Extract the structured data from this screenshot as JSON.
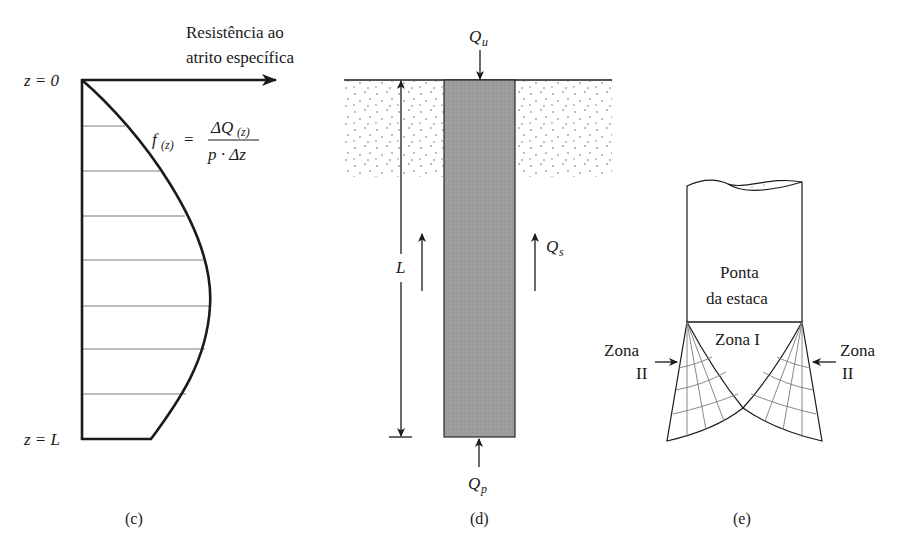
{
  "panels": {
    "c": {
      "caption": "(c)",
      "axis_title_line1": "Resistência ao",
      "axis_title_line2": "atrito específica",
      "z_top_label": "z = 0",
      "z_bottom_label": "z = L",
      "formula": {
        "lhs_f": "f",
        "lhs_sub": "(z)",
        "equals": "=",
        "numerator": "ΔQ",
        "numerator_sub": "(z)",
        "denominator": "p · Δz"
      }
    },
    "d": {
      "caption": "(d)",
      "load_top": "Q",
      "load_top_sub": "u",
      "shaft_resistance": "Q",
      "shaft_resistance_sub": "s",
      "point_resistance": "Q",
      "point_resistance_sub": "p",
      "length_label": "L"
    },
    "e": {
      "caption": "(e)",
      "pile_tip_line1": "Ponta",
      "pile_tip_line2": "da estaca",
      "zone_1": "Zona I",
      "zone_2_left_line1": "Zona",
      "zone_2_left_line2": "II",
      "zone_2_right_line1": "Zona",
      "zone_2_right_line2": "II"
    }
  },
  "colors": {
    "line": "#1a1a1a",
    "pile_fill": "#9a9a9a",
    "soil_dots": "#6a6a6a",
    "hatch": "#7a7a7a"
  }
}
